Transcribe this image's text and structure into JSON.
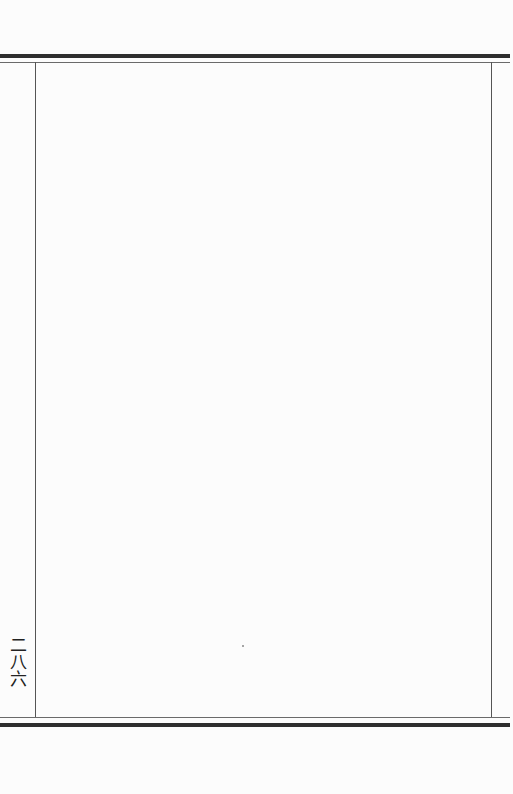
{
  "page": {
    "page_number": "二八六",
    "body_text": ""
  }
}
